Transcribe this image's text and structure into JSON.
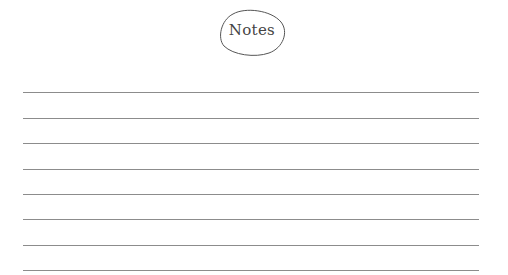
{
  "header": {
    "title": "Notes"
  },
  "lines": {
    "count": 8,
    "positions_y": [
      92,
      118,
      143,
      169,
      194,
      219,
      245,
      270
    ],
    "color": "#8c8c8c"
  }
}
